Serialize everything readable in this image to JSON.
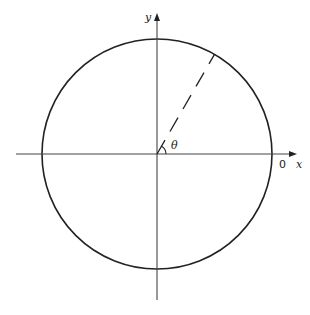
{
  "diagram": {
    "type": "unit-circle-angle",
    "labels": {
      "y_axis": "y",
      "x_axis": "x",
      "angle": "θ",
      "origin_point": "0"
    },
    "geometry": {
      "center": [
        157,
        154
      ],
      "radius": 115,
      "angle_deg": 60,
      "radius_line_style": "dashed"
    },
    "colors": {
      "stroke": "#222222",
      "axis": "#444444",
      "background": "#ffffff"
    }
  }
}
